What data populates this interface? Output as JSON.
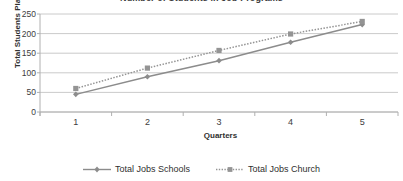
{
  "chart_data": {
    "type": "line",
    "title": "Number of Students in Job Programs",
    "xlabel": "Quarters",
    "ylabel": "Total Students Placed",
    "categories": [
      "1",
      "2",
      "3",
      "4",
      "5"
    ],
    "x": [
      1,
      2,
      3,
      4,
      5
    ],
    "ylim": [
      0,
      250
    ],
    "yticks": [
      0,
      50,
      100,
      150,
      200,
      250
    ],
    "ytick_labels": [
      "0",
      "50",
      "100",
      "150",
      "200",
      "250"
    ],
    "xtick_labels": [
      "1",
      "2",
      "3",
      "4",
      "5"
    ],
    "grid": "horizontal",
    "legend_position": "bottom-center",
    "series": [
      {
        "name": "Total Jobs Schools",
        "values": [
          45,
          90,
          131,
          178,
          223
        ],
        "line_style": "solid",
        "marker": "diamond",
        "color": "#8c8c8c"
      },
      {
        "name": "Total Jobs Church",
        "values": [
          60,
          112,
          157,
          199,
          231
        ],
        "line_style": "dotted",
        "marker": "square",
        "color": "#949494"
      }
    ]
  },
  "legend": {
    "items": [
      {
        "label": "Total Jobs Schools"
      },
      {
        "label": "Total Jobs Church"
      }
    ]
  },
  "colors": {
    "axis": "#b0b0b0",
    "grid": "#bdbdbd",
    "text": "#3d3d3d",
    "series_schools": "#8c8c8c",
    "series_church": "#949494"
  }
}
